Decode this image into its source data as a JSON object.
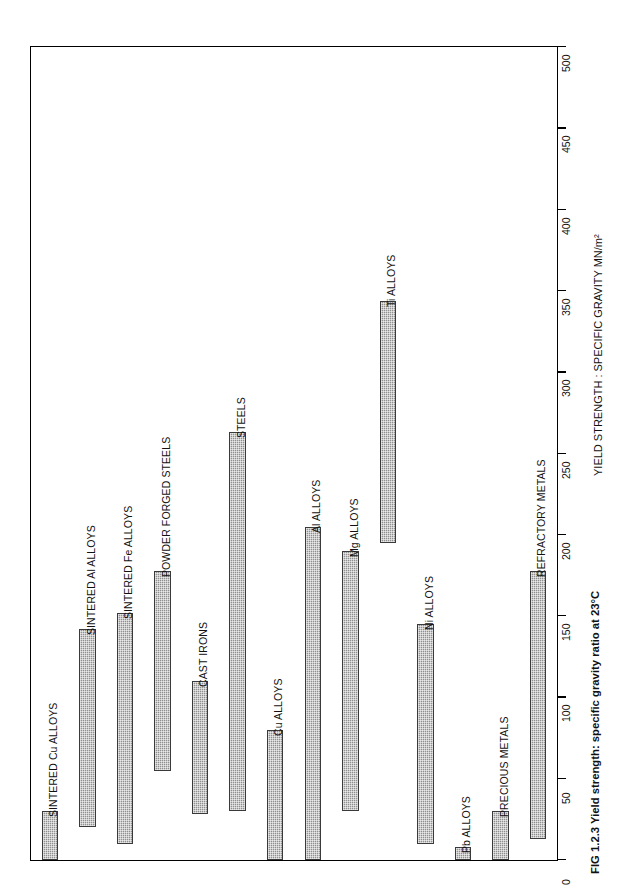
{
  "figure": {
    "caption": "FIG 1.2.3 Yield strength: specific gravity ratio at 23°C",
    "axis_title": "YIELD STRENGTH : SPECIFIC GRAVITY MN/m²"
  },
  "chart_data": {
    "type": "bar",
    "orientation": "rotated-90-floating-range",
    "title": "FIG 1.2.3 Yield strength: specific gravity ratio at 23°C",
    "xlabel": "",
    "ylabel": "YIELD STRENGTH : SPECIFIC GRAVITY MN/m²",
    "ylim": [
      0,
      500
    ],
    "yticks": [
      0,
      50,
      100,
      150,
      200,
      250,
      300,
      350,
      400,
      450,
      500
    ],
    "ytick_labels": [
      "0",
      "50",
      "100",
      "150",
      "200",
      "250",
      "300",
      "350",
      "400",
      "450",
      "500"
    ],
    "grid": false,
    "legend": null,
    "units": "MN/m²",
    "categories": [
      "SINTERED Cu ALLOYS",
      "SINTERED Al ALLOYS",
      "SINTERED Fe ALLOYS",
      "POWDER FORGED STEELS",
      "CAST IRONS",
      "STEELS",
      "Cu ALLOYS",
      "Al ALLOYS",
      "Mg ALLOYS",
      "Ti ALLOYS",
      "Ni ALLOYS",
      "Pb ALLOYS",
      "PRECIOUS METALS",
      "REFRACTORY METALS"
    ],
    "ranges": [
      {
        "name": "SINTERED Cu ALLOYS",
        "low": 0,
        "high": 30
      },
      {
        "name": "SINTERED Al ALLOYS",
        "low": 20,
        "high": 142
      },
      {
        "name": "SINTERED Fe ALLOYS",
        "low": 10,
        "high": 152
      },
      {
        "name": "POWDER FORGED STEELS",
        "low": 55,
        "high": 178
      },
      {
        "name": "CAST IRONS",
        "low": 28,
        "high": 110
      },
      {
        "name": "STEELS",
        "low": 30,
        "high": 263
      },
      {
        "name": "Cu ALLOYS",
        "low": 0,
        "high": 80
      },
      {
        "name": "Al ALLOYS",
        "low": 0,
        "high": 205
      },
      {
        "name": "Mg ALLOYS",
        "low": 30,
        "high": 190
      },
      {
        "name": "Ti ALLOYS",
        "low": 195,
        "high": 344
      },
      {
        "name": "Ni ALLOYS",
        "low": 10,
        "high": 145
      },
      {
        "name": "Pb ALLOYS",
        "low": 0,
        "high": 8
      },
      {
        "name": "PRECIOUS METALS",
        "low": 0,
        "high": 30
      },
      {
        "name": "REFRACTORY METALS",
        "low": 13,
        "high": 178
      }
    ],
    "values": [
      30,
      142,
      152,
      178,
      110,
      263,
      80,
      205,
      190,
      344,
      145,
      8,
      30,
      178
    ]
  },
  "axis": {
    "ticks": [
      {
        "value": 0,
        "label": "0"
      },
      {
        "value": 50,
        "label": "50"
      },
      {
        "value": 100,
        "label": "100"
      },
      {
        "value": 150,
        "label": "150"
      },
      {
        "value": 200,
        "label": "200"
      },
      {
        "value": 250,
        "label": "250"
      },
      {
        "value": 300,
        "label": "300"
      },
      {
        "value": 350,
        "label": "350"
      },
      {
        "value": 400,
        "label": "400"
      },
      {
        "value": 450,
        "label": "450"
      },
      {
        "value": 500,
        "label": "500"
      }
    ]
  },
  "colors": {
    "bar_fill": "#8f8f8f",
    "bar_stroke": "#3a3a3a",
    "frame": "#000000",
    "background": "#ffffff",
    "text": "#111111"
  }
}
